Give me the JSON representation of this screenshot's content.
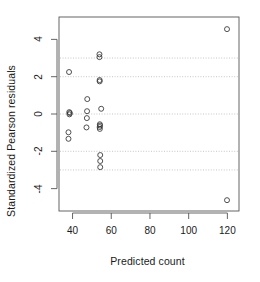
{
  "chart_data": {
    "type": "scatter",
    "title": "",
    "xlabel": "Predicted count",
    "ylabel": "Standardized Pearson residuals",
    "xlim": [
      33,
      126
    ],
    "ylim": [
      -5.2,
      5.2
    ],
    "xticks": [
      40,
      60,
      80,
      100,
      120
    ],
    "yticks": [
      -4,
      -2,
      0,
      2,
      4
    ],
    "grid": true,
    "grid_style": "dotted",
    "gridlines_y": [
      -3,
      -2,
      0,
      2,
      3
    ],
    "legend": "none",
    "marker": "open-circle",
    "marker_color": "#333333",
    "points": [
      {
        "x": 38.2,
        "y": 2.25
      },
      {
        "x": 38.3,
        "y": 0.1
      },
      {
        "x": 38.4,
        "y": -0.02
      },
      {
        "x": 38.6,
        "y": 0.05
      },
      {
        "x": 37.9,
        "y": -0.98
      },
      {
        "x": 37.9,
        "y": -1.33
      },
      {
        "x": 47.6,
        "y": 0.8
      },
      {
        "x": 47.5,
        "y": 0.15
      },
      {
        "x": 47.4,
        "y": -0.22
      },
      {
        "x": 47.2,
        "y": -0.72
      },
      {
        "x": 53.9,
        "y": 3.2
      },
      {
        "x": 53.9,
        "y": 3.05
      },
      {
        "x": 54.0,
        "y": 1.82
      },
      {
        "x": 54.0,
        "y": 1.75
      },
      {
        "x": 54.8,
        "y": 0.28
      },
      {
        "x": 54.1,
        "y": -0.55
      },
      {
        "x": 54.2,
        "y": -0.62
      },
      {
        "x": 54.0,
        "y": -0.7
      },
      {
        "x": 54.1,
        "y": -0.8
      },
      {
        "x": 54.3,
        "y": -2.2
      },
      {
        "x": 54.3,
        "y": -2.52
      },
      {
        "x": 54.3,
        "y": -2.85
      },
      {
        "x": 119.8,
        "y": 4.55
      },
      {
        "x": 119.8,
        "y": -4.62
      }
    ]
  },
  "colors": {
    "axis": "#555555",
    "grid": "#b8b8b8",
    "marker": "#333333",
    "text": "#1a1a1a",
    "background": "#ffffff"
  },
  "axis": {
    "x_tick_labels": [
      "40",
      "60",
      "80",
      "100",
      "120"
    ],
    "y_tick_labels": [
      "4",
      "2",
      "0",
      "-2",
      "-4"
    ]
  }
}
